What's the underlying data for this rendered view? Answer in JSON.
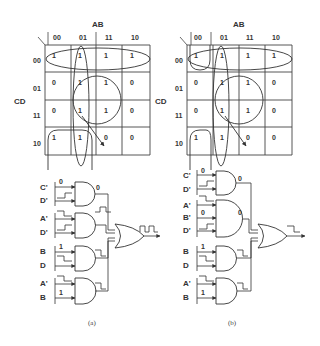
{
  "figure": {
    "panels": [
      {
        "caption": "(a)",
        "kmap": {
          "col_var": "AB",
          "row_var": "CD",
          "col_headers": [
            "00",
            "01",
            "11",
            "10"
          ],
          "row_headers": [
            "00",
            "01",
            "11",
            "10"
          ],
          "cells": [
            [
              "1",
              "1",
              "1",
              "1"
            ],
            [
              "0",
              "1",
              "1",
              "0"
            ],
            [
              "0",
              "1",
              "1",
              "0"
            ],
            [
              "1",
              "1",
              "0",
              "0"
            ]
          ]
        },
        "gates": [
          {
            "inputs": [
              "C'",
              "D'"
            ],
            "input_marks": [
              "0",
              "step-up"
            ],
            "output_mark": "0"
          },
          {
            "inputs": [
              "A'",
              "D'"
            ],
            "input_marks": [
              "step-down",
              "step-up"
            ],
            "output_mark": "pulse"
          },
          {
            "inputs": [
              "B",
              "D"
            ],
            "input_marks": [
              "1",
              "step-down"
            ],
            "output_mark": "step-down"
          },
          {
            "inputs": [
              "A'",
              "B"
            ],
            "input_marks": [
              "step-down",
              "1"
            ],
            "output_mark": "step-down"
          }
        ],
        "or_output_mark": "glitch-pulse"
      },
      {
        "caption": "(b)",
        "kmap": {
          "col_var": "AB",
          "row_var": "CD",
          "col_headers": [
            "00",
            "01",
            "11",
            "10"
          ],
          "row_headers": [
            "00",
            "01",
            "11",
            "10"
          ],
          "cells": [
            [
              "1",
              "1",
              "1",
              "1"
            ],
            [
              "0",
              "1",
              "1",
              "0"
            ],
            [
              "0",
              "1",
              "1",
              "0"
            ],
            [
              "1",
              "1",
              "0",
              "0"
            ]
          ]
        },
        "gates": [
          {
            "inputs": [
              "C'",
              "D'"
            ],
            "input_marks": [
              "0",
              "step-up"
            ],
            "output_mark": "0"
          },
          {
            "inputs": [
              "A'",
              "B'",
              "D'"
            ],
            "input_marks": [
              "step-down",
              "0",
              "step-up"
            ],
            "output_mark": "0"
          },
          {
            "inputs": [
              "B",
              "D"
            ],
            "input_marks": [
              "1",
              "step-down"
            ],
            "output_mark": "step-down"
          },
          {
            "inputs": [
              "A'",
              "B"
            ],
            "input_marks": [
              "step-down",
              "1"
            ],
            "output_mark": "step-down"
          }
        ],
        "or_output_mark": "clean-step-down"
      }
    ]
  }
}
